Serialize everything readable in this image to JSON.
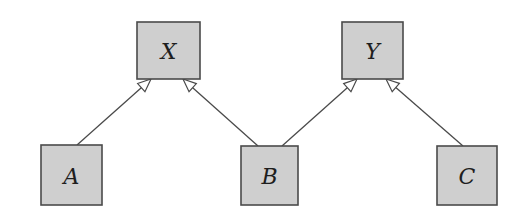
{
  "diagram": {
    "type": "inheritance-hierarchy",
    "colors": {
      "node_fill": "#cfcfcf",
      "node_stroke": "#4a4a4a",
      "edge_stroke": "#4a4a4a",
      "arrow_fill": "#ffffff",
      "label_color": "#1e1e1e"
    },
    "nodes": [
      {
        "id": "X",
        "label": "X",
        "level": "parent"
      },
      {
        "id": "Y",
        "label": "Y",
        "level": "parent"
      },
      {
        "id": "A",
        "label": "A",
        "level": "child"
      },
      {
        "id": "B",
        "label": "B",
        "level": "child"
      },
      {
        "id": "C",
        "label": "C",
        "level": "child"
      }
    ],
    "edges": [
      {
        "from": "A",
        "to": "X",
        "arrow": "hollow-triangle"
      },
      {
        "from": "B",
        "to": "X",
        "arrow": "hollow-triangle"
      },
      {
        "from": "B",
        "to": "Y",
        "arrow": "hollow-triangle"
      },
      {
        "from": "C",
        "to": "Y",
        "arrow": "hollow-triangle"
      }
    ]
  }
}
